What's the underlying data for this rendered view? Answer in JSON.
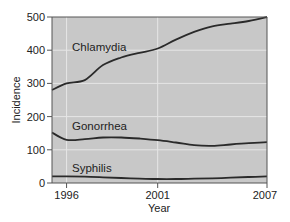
{
  "chart_data": {
    "type": "line",
    "title": "",
    "xlabel": "Year",
    "ylabel": "Incidence",
    "xlim": [
      1995.2,
      2007
    ],
    "ylim": [
      0,
      500
    ],
    "x_ticks": [
      1996,
      2001,
      2007
    ],
    "y_ticks": [
      0,
      100,
      200,
      300,
      400,
      500
    ],
    "grid": true,
    "legend": "inline labels",
    "x": [
      1995.2,
      1996,
      1997,
      1998,
      1999,
      2000,
      2001,
      2002,
      2003,
      2004,
      2005,
      2006,
      2007
    ],
    "series": [
      {
        "name": "Chlamydia",
        "values": [
          280,
          300,
          310,
          355,
          378,
          392,
          405,
          432,
          455,
          472,
          480,
          488,
          500
        ]
      },
      {
        "name": "Gonorrhea",
        "values": [
          152,
          130,
          132,
          137,
          137,
          134,
          129,
          122,
          114,
          112,
          116,
          120,
          123
        ]
      },
      {
        "name": "Syphilis",
        "values": [
          20,
          20,
          19,
          17,
          15,
          13,
          12,
          12,
          13,
          14,
          16,
          18,
          20
        ]
      }
    ]
  },
  "labels": {
    "xlabel": "Year",
    "ylabel": "Incidence",
    "series": [
      "Chlamydia",
      "Gonorrhea",
      "Syphilis"
    ]
  },
  "colors": {
    "plot_bg": "#c8c8c8",
    "grid": "#e6e6e6",
    "line": "#2a2a2a",
    "axis": "#555555"
  }
}
